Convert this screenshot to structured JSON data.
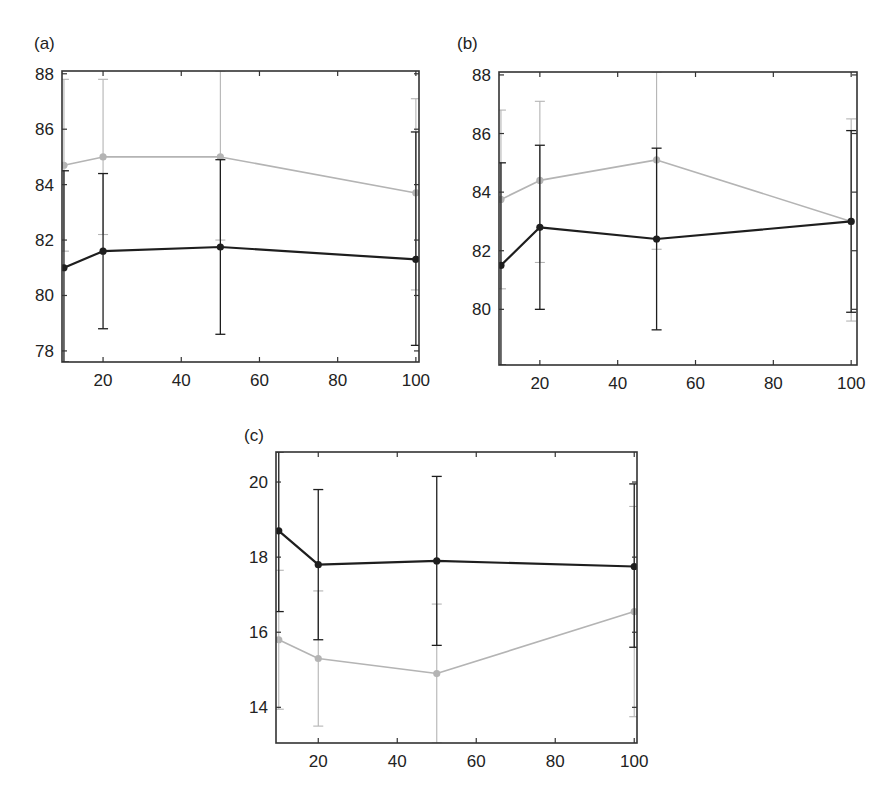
{
  "figure": {
    "series_styles": {
      "dark": {
        "color": "#1e1e1e",
        "width": 2.2
      },
      "light": {
        "color": "#b4b4b4",
        "width": 1.6
      }
    }
  },
  "chart_data": [
    {
      "type": "line",
      "title": "(a)",
      "xlabel": "",
      "ylabel": "",
      "x": [
        10,
        20,
        50,
        100
      ],
      "xlim": [
        9.5,
        100.8
      ],
      "ylim": [
        77.6,
        88.1
      ],
      "xticks": [
        20,
        40,
        60,
        80,
        100
      ],
      "yticks": [
        78,
        80,
        82,
        84,
        86,
        88
      ],
      "grid": false,
      "legend": null,
      "series": [
        {
          "name": "light",
          "color": "#b4b4b4",
          "values": [
            84.7,
            85.0,
            85.0,
            83.7
          ],
          "err_upper": [
            87.8,
            87.8,
            88.1,
            87.1
          ],
          "err_lower": [
            81.6,
            82.2,
            82.0,
            80.2
          ]
        },
        {
          "name": "dark",
          "color": "#1e1e1e",
          "values": [
            81.0,
            81.6,
            81.75,
            81.3
          ],
          "err_upper": [
            84.5,
            84.4,
            84.9,
            85.9
          ],
          "err_lower": [
            77.6,
            78.8,
            78.6,
            78.2
          ]
        }
      ]
    },
    {
      "type": "line",
      "title": "(b)",
      "xlabel": "",
      "ylabel": "",
      "x": [
        10,
        20,
        50,
        100
      ],
      "xlim": [
        9.5,
        101.5
      ],
      "ylim": [
        78.1,
        88.1
      ],
      "xticks": [
        20,
        40,
        60,
        80,
        100
      ],
      "yticks": [
        80,
        82,
        84,
        86,
        88
      ],
      "grid": false,
      "legend": null,
      "series": [
        {
          "name": "light",
          "color": "#b4b4b4",
          "values": [
            83.75,
            84.4,
            85.1,
            83.0
          ],
          "err_upper": [
            86.8,
            87.1,
            88.1,
            86.5
          ],
          "err_lower": [
            80.7,
            81.6,
            82.05,
            79.6
          ]
        },
        {
          "name": "dark",
          "color": "#1e1e1e",
          "values": [
            81.5,
            82.8,
            82.4,
            83.0
          ],
          "err_upper": [
            85.0,
            85.6,
            85.5,
            86.1
          ],
          "err_lower": [
            78.1,
            80.0,
            79.3,
            79.9
          ]
        }
      ]
    },
    {
      "type": "line",
      "title": "(c)",
      "xlabel": "",
      "ylabel": "",
      "x": [
        10,
        20,
        50,
        100
      ],
      "xlim": [
        9.3,
        100.7
      ],
      "ylim": [
        13.05,
        20.8
      ],
      "xticks": [
        20,
        40,
        60,
        80,
        100
      ],
      "yticks": [
        14,
        16,
        18,
        20
      ],
      "grid": false,
      "legend": null,
      "series": [
        {
          "name": "dark",
          "color": "#1e1e1e",
          "values": [
            18.7,
            17.8,
            17.9,
            17.75
          ],
          "err_upper": [
            20.8,
            19.8,
            20.15,
            19.95
          ],
          "err_lower": [
            16.55,
            15.8,
            15.65,
            15.6
          ]
        },
        {
          "name": "light",
          "color": "#b4b4b4",
          "values": [
            15.8,
            15.3,
            14.9,
            16.55
          ],
          "err_upper": [
            17.65,
            17.1,
            16.75,
            19.35
          ],
          "err_lower": [
            13.95,
            13.5,
            13.05,
            13.75
          ]
        }
      ]
    }
  ]
}
